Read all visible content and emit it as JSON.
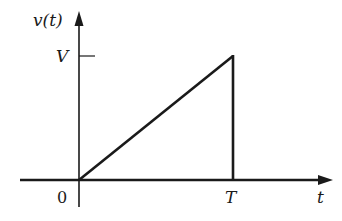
{
  "figure": {
    "type": "sawtooth-pulse-waveform",
    "y_axis_label": "v(t)",
    "x_axis_label": "t",
    "y_tick_label": "V",
    "x_tick_labels": {
      "origin": "0",
      "end": "T"
    },
    "colors": {
      "stroke": "#1a1a1a",
      "background": "#ffffff"
    }
  },
  "geometry": {
    "origin": [
      79,
      180
    ],
    "x_axis": {
      "x1": 20,
      "x2": 326,
      "arrow_tip": 332
    },
    "y_axis": {
      "y1": 207,
      "y2": 18,
      "arrow_tip": 12
    },
    "v_tick": {
      "y": 56,
      "x1": 79,
      "x2": 95
    },
    "ramp": {
      "start": [
        79,
        180
      ],
      "peak": [
        233,
        56
      ]
    },
    "drop": {
      "x": 233,
      "y1": 56,
      "y2": 180
    }
  }
}
